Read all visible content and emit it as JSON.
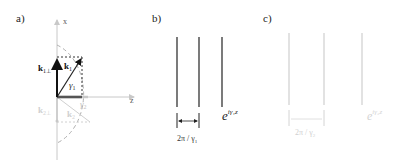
{
  "figure": {
    "panels": [
      {
        "id": "a",
        "label": "a)",
        "axes": {
          "vertical": "x",
          "horizontal": "z"
        },
        "vectors": [
          {
            "name": "k1",
            "label": "k",
            "subscript": "1",
            "style": "bold-dark"
          },
          {
            "name": "k1-perp",
            "label": "k",
            "subscript": "1⊥",
            "style": "bold-dark"
          },
          {
            "name": "k2",
            "label": "k",
            "subscript": "2",
            "style": "faded"
          },
          {
            "name": "k2-perp",
            "label": "k",
            "subscript": "2⊥",
            "style": "faded"
          }
        ],
        "angles": [
          {
            "label": "γ",
            "subscript": "1",
            "style": "dark"
          },
          {
            "label": "γ",
            "subscript": "2",
            "style": "faded"
          }
        ],
        "circle": "dashed semicircle"
      },
      {
        "id": "b",
        "label": "b)",
        "spacing_label": "2π / γ",
        "spacing_subscript": "1",
        "wave_label_base": "e",
        "wave_label_exp": "iγ₁z",
        "line_color": "#333333"
      },
      {
        "id": "c",
        "label": "c)",
        "spacing_label": "2π / γ",
        "spacing_subscript": "2",
        "wave_label_base": "e",
        "wave_label_exp": "iγ₂z",
        "line_color": "#c8c8c8"
      }
    ]
  }
}
